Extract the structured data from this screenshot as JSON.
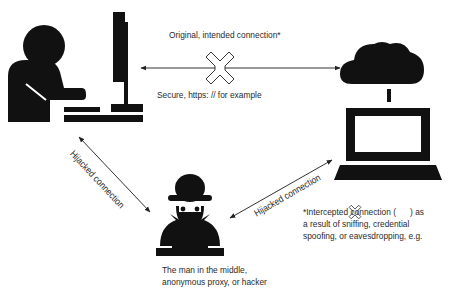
{
  "diagram": {
    "type": "man-in-the-middle attack illustration",
    "nodes": {
      "user": {
        "icon": "person-at-desktop-computer-icon"
      },
      "server": {
        "icon": "cloud-connected-laptop-icon"
      },
      "attacker": {
        "icon": "hacker-with-laptop-icon",
        "label_line1": "The man in the middle,",
        "label_line2": "anonymous proxy, or hacker"
      }
    },
    "edges": {
      "intended": {
        "label_top": "Original, intended connection*",
        "label_bottom": "Secure, https: // for example",
        "marker": "intercepted-x-icon"
      },
      "hijacked_left": {
        "label": "Hijacked connection"
      },
      "hijacked_right": {
        "label": "Hijacked connection"
      }
    },
    "footnote": {
      "line1_before": "*Intercepted connection (",
      "line1_after": ") as",
      "line2": "a result of sniffing, credential",
      "line3": "spoofing, or eavesdropping, e.g."
    },
    "colors": {
      "ink": "#1a1a1a",
      "line": "#333333",
      "background": "#ffffff"
    }
  }
}
